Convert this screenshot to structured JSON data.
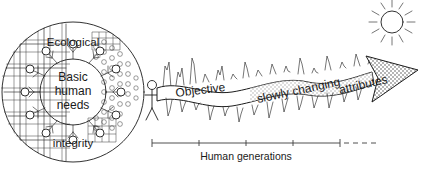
{
  "figure": {
    "background_color": "#ffffff",
    "ink_color": "#1c1c1c"
  },
  "circle_diagram": {
    "name": "ecological-integrity-circle",
    "top_label": "Ecological",
    "center_label_line1": "Basic",
    "center_label_line2": "human",
    "center_label_line3": "needs",
    "bottom_label": "integrity",
    "outer_node_count": 12,
    "textures": {
      "left": "grid-mesh",
      "right": "bubble-circles"
    }
  },
  "band": {
    "name": "objective-attributes-band",
    "label_part1": "Objective",
    "label_part2": "slowly changing",
    "label_part3": "attributes",
    "full_label": "Objective slowly changing attributes",
    "arrow_direction": "right",
    "arrow_fill": "stipple"
  },
  "sun": {
    "name": "sun-icon",
    "ray_count": 12
  },
  "human_figure": {
    "name": "stick-figure-person"
  },
  "axis": {
    "name": "human-generations-axis",
    "label": "Human generations",
    "tick_count": 5,
    "has_dashed_continuation": true
  }
}
